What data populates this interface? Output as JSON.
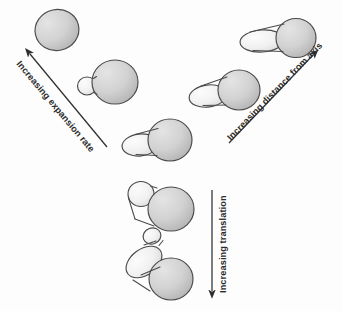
{
  "figure": {
    "title": "",
    "background_color": "#fdfdfd",
    "width": 343,
    "height": 311
  },
  "palette": {
    "mother_fill_light": "#dcdcdc",
    "mother_fill_dark": "#b9b9b9",
    "bud_fill_light": "#fafafa",
    "bud_fill_dark": "#dedede",
    "outline": "#4a4a4a",
    "arrow": "#2f2f2f",
    "label_text": "#2b2b2b"
  },
  "axes": [
    {
      "id": "expansion-rate",
      "label": "Increasing expansion rate",
      "direction": "up-left",
      "tail": {
        "x": 107,
        "y": 147
      },
      "tip": {
        "x": 26,
        "y": 50
      },
      "label_rotation_deg": 50,
      "label_anchor": {
        "x": 16,
        "y": 64
      }
    },
    {
      "id": "distance-from-axis",
      "label": "Increasing distance from axis",
      "direction": "up-right",
      "tail": {
        "x": 229,
        "y": 143
      },
      "tip": {
        "x": 316,
        "y": 52
      },
      "label_rotation_deg": -46,
      "label_anchor": {
        "x": 231,
        "y": 141
      }
    },
    {
      "id": "translation",
      "label": "Increasing translation",
      "direction": "down",
      "tail": {
        "x": 212,
        "y": 190
      },
      "tip": {
        "x": 212,
        "y": 295
      },
      "label_rotation_deg": -90,
      "label_anchor": {
        "x": 226,
        "y": 293
      }
    }
  ],
  "cells": [
    {
      "id": "cell-origin",
      "name": "unbudded-round-cell",
      "stage": "no bud",
      "position": {
        "x": 57,
        "y": 30
      },
      "mother": {
        "cx": 0,
        "cy": 0,
        "rx": 22,
        "ry": 20.5
      },
      "bud": null,
      "branch": "expansion-rate"
    },
    {
      "id": "cell-small-bud",
      "name": "cell-with-small-round-bud",
      "stage": "small bud",
      "position": {
        "x": 107,
        "y": 82
      },
      "mother": {
        "cx": 8,
        "cy": 0,
        "rx": 23,
        "ry": 22
      },
      "bud": {
        "cx": -20,
        "cy": 4,
        "rx": 9.5,
        "ry": 9,
        "rotation": 0
      },
      "branch": "expansion-rate"
    },
    {
      "id": "cell-center",
      "name": "cell-with-oval-bud-center",
      "stage": "medium oval bud",
      "position": {
        "x": 160,
        "y": 140
      },
      "mother": {
        "cx": 10,
        "cy": 0,
        "rx": 22,
        "ry": 21
      },
      "bud": {
        "cx": -20,
        "cy": 5,
        "rx": 18,
        "ry": 11,
        "rotation": -6
      },
      "branch": "center"
    },
    {
      "id": "cell-distal-1",
      "name": "cell-with-elongated-bud",
      "stage": "elongated bud",
      "position": {
        "x": 228,
        "y": 90
      },
      "mother": {
        "cx": 11,
        "cy": 0,
        "rx": 21,
        "ry": 20
      },
      "bud": {
        "cx": -20,
        "cy": 6,
        "rx": 19,
        "ry": 11,
        "rotation": -8
      },
      "branch": "distance-from-axis"
    },
    {
      "id": "cell-distal-2",
      "name": "cell-with-long-horizontal-bud",
      "stage": "long bud",
      "position": {
        "x": 280,
        "y": 38
      },
      "mother": {
        "cx": 16,
        "cy": 0,
        "rx": 20,
        "ry": 19.5
      },
      "bud": {
        "cx": -18,
        "cy": 3,
        "rx": 22,
        "ry": 11,
        "rotation": -4
      },
      "branch": "distance-from-axis"
    },
    {
      "id": "cell-translate-1",
      "name": "cell-with-offset-round-bud",
      "stage": "translated bud",
      "position": {
        "x": 160,
        "y": 205
      },
      "mother": {
        "cx": 11,
        "cy": 4,
        "rx": 23,
        "ry": 22
      },
      "bud": {
        "cx": -19,
        "cy": -11,
        "rx": 13,
        "ry": 12.5,
        "rotation": 0
      },
      "branch": "translation"
    },
    {
      "id": "cell-translate-2",
      "name": "chain-of-three-compartments",
      "stage": "chained translation",
      "position": {
        "x": 158,
        "y": 265
      },
      "mother": {
        "cx": 13,
        "cy": 14,
        "rx": 22,
        "ry": 21
      },
      "bud": {
        "cx": -14,
        "cy": -3,
        "rx": 20,
        "ry": 13,
        "rotation": -36
      },
      "grandbud": {
        "cx": -6,
        "cy": -29,
        "rx": 9,
        "ry": 8,
        "rotation": -20
      },
      "branch": "translation"
    }
  ]
}
